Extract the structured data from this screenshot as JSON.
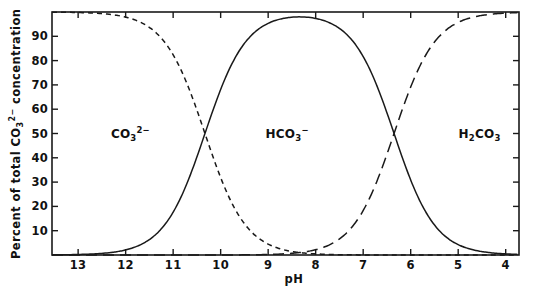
{
  "chart_data": {
    "type": "line",
    "title": "",
    "xlabel": "pH",
    "ylabel": "Percent of total CO3 2- concentration",
    "ylabel_parts": {
      "pre": "Percent of total CO",
      "sub": "3",
      "sup": "2−",
      "post": " concentration"
    },
    "xlim": [
      13.55,
      3.72
    ],
    "ylim": [
      0,
      100
    ],
    "x_reversed": true,
    "grid": false,
    "legend": "none (in-plot species annotations)",
    "xticks": [
      13,
      12,
      11,
      10,
      9,
      8,
      7,
      6,
      5,
      4
    ],
    "xtick_labels": [
      "13",
      "12",
      "11",
      "10",
      "9",
      "8",
      "7",
      "6",
      "5",
      "4"
    ],
    "yticks": [
      10,
      20,
      30,
      40,
      50,
      60,
      70,
      80,
      90
    ],
    "ytick_labels": [
      "10",
      "20",
      "30",
      "40",
      "50",
      "60",
      "70",
      "80",
      "90"
    ],
    "ytick_minor": [
      0,
      100
    ],
    "pKa1": 6.35,
    "pKa2": 10.33,
    "x": [
      13.5,
      13.0,
      12.5,
      12.0,
      11.5,
      11.0,
      10.8,
      10.6,
      10.33,
      10.0,
      9.5,
      9.0,
      8.5,
      8.0,
      7.5,
      7.0,
      6.8,
      6.6,
      6.35,
      6.0,
      5.5,
      5.0,
      4.5,
      4.0,
      3.75
    ],
    "series": [
      {
        "name": "CO3 2-",
        "label_html": "CO<sub>3</sub><sup>2−</sup>",
        "linestyle": "dashed",
        "color": "#1a1a1a",
        "annotation_x": 11.9,
        "annotation_y": 50,
        "values": [
          99.3,
          97.9,
          93.6,
          82.3,
          59.7,
          32.4,
          23.0,
          15.7,
          10.0,
          5.3,
          1.7,
          0.55,
          0.17,
          0.05,
          0.02,
          0.0,
          0.0,
          0.0,
          0.0,
          0.0,
          0.0,
          0.0,
          0.0,
          0.0,
          0.0
        ]
      },
      {
        "name": "HCO3-",
        "label_html": "HCO<sub>3</sub><sup>−</sup>",
        "linestyle": "solid",
        "color": "#1a1a1a",
        "annotation_x": 8.6,
        "annotation_y": 50,
        "values": [
          0.7,
          2.1,
          6.4,
          17.7,
          40.3,
          67.5,
          76.9,
          84.2,
          90.0,
          94.6,
          98.1,
          99.2,
          99.5,
          99.3,
          98.0,
          94.1,
          91.1,
          86.1,
          80.0,
          69.1,
          41.4,
          18.2,
          6.6,
          2.2,
          1.3
        ]
      },
      {
        "name": "H2CO3",
        "label_html": "H<sub>2</sub>CO<sub>3</sub>",
        "linestyle": "longdash",
        "color": "#1a1a1a",
        "annotation_x": 4.55,
        "annotation_y": 50,
        "values": [
          0.0,
          0.0,
          0.0,
          0.0,
          0.0,
          0.0,
          0.0,
          0.0,
          0.0,
          0.0,
          0.02,
          0.05,
          0.17,
          0.55,
          1.7,
          5.3,
          8.2,
          13.1,
          20.0,
          30.9,
          58.6,
          81.8,
          93.4,
          97.8,
          98.7
        ]
      }
    ]
  },
  "axes": {
    "x_title": "pH",
    "frame": {
      "left": 52,
      "top": 12,
      "right": 519,
      "bottom": 255
    }
  }
}
